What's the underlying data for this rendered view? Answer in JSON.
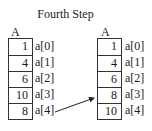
{
  "title": "Fourth Step",
  "before": {
    "label": "A",
    "values": [
      "1",
      "4",
      "6",
      "10",
      "8"
    ],
    "indices": [
      "a[0]",
      "a[1]",
      "a[2]",
      "a[3]",
      "a[4]"
    ]
  },
  "after": {
    "label": "A",
    "values": [
      "1",
      "4",
      "6",
      "8",
      "10"
    ],
    "indices": [
      "a[0]",
      "a[1]",
      "a[2]",
      "a[3]",
      "a[4]"
    ]
  },
  "arrow": {
    "from": "before a[4]",
    "to": "after a[3]"
  }
}
